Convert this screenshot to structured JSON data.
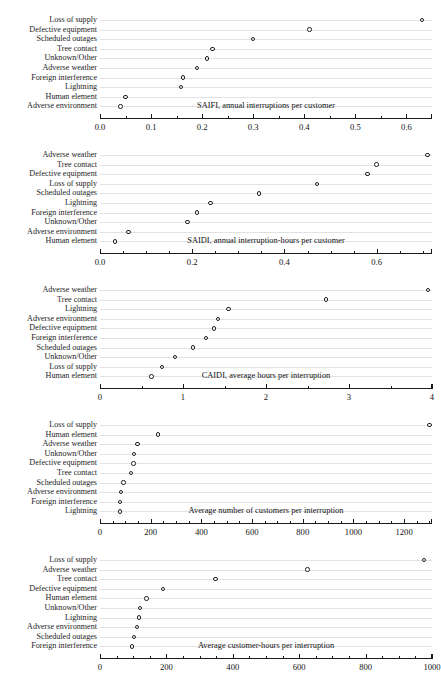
{
  "figure": {
    "panel_count": 5,
    "marker": "open-circle",
    "grid": "horizontal-dotted-guides"
  },
  "chart_data": [
    {
      "type": "scatter",
      "title": "SAIFI, annual interruptions per customer",
      "xlabel": "",
      "ylabel": "",
      "orientation": "horizontal-dot-plot",
      "xlim": [
        0.0,
        0.65
      ],
      "xticks": [
        0.0,
        0.1,
        0.2,
        0.3,
        0.4,
        0.5,
        0.6
      ],
      "xticklabels": [
        "0.0",
        "0.1",
        "0.2",
        "0.3",
        "0.4",
        "0.5",
        "0.6"
      ],
      "minor_ticks": [
        0.05,
        0.15,
        0.25,
        0.35,
        0.45,
        0.55
      ],
      "categories": [
        "Loss of supply",
        "Defective equipment",
        "Scheduled outages",
        "Tree contact",
        "Unknown/Other",
        "Adverse weather",
        "Foreign interference",
        "Lightning",
        "Human element",
        "Adverse environment"
      ],
      "values": [
        0.63,
        0.41,
        0.3,
        0.22,
        0.21,
        0.19,
        0.163,
        0.158,
        0.05,
        0.04
      ]
    },
    {
      "type": "scatter",
      "title": "SAIDI, annual interruption-hours per customer",
      "xlabel": "",
      "ylabel": "",
      "orientation": "horizontal-dot-plot",
      "xlim": [
        0.0,
        0.72
      ],
      "xticks": [
        0.0,
        0.2,
        0.4,
        0.6
      ],
      "xticklabels": [
        "0.0",
        "0.2",
        "0.4",
        "0.6"
      ],
      "minor_ticks": [
        0.05,
        0.1,
        0.15,
        0.25,
        0.3,
        0.35,
        0.45,
        0.5,
        0.55,
        0.65,
        0.7
      ],
      "categories": [
        "Adverse weather",
        "Tree contact",
        "Defective equipment",
        "Loss of supply",
        "Scheduled outages",
        "Lightning",
        "Foreign interference",
        "Unknown/Other",
        "Adverse environment",
        "Human element"
      ],
      "values": [
        0.71,
        0.6,
        0.58,
        0.47,
        0.345,
        0.24,
        0.21,
        0.19,
        0.062,
        0.032
      ]
    },
    {
      "type": "scatter",
      "title": "CAIDI, average hours per interruption",
      "xlabel": "",
      "ylabel": "",
      "orientation": "horizontal-dot-plot",
      "xlim": [
        0,
        4
      ],
      "xticks": [
        0,
        1,
        2,
        3,
        4
      ],
      "xticklabels": [
        "0",
        "1",
        "2",
        "3",
        "4"
      ],
      "minor_ticks": [
        0.5,
        1.5,
        2.5,
        3.5
      ],
      "categories": [
        "Adverse weather",
        "Tree contact",
        "Lightning",
        "Adverse environment",
        "Defective equipment",
        "Foreign interference",
        "Scheduled outages",
        "Unknown/Other",
        "Loss of supply",
        "Human element"
      ],
      "values": [
        3.95,
        2.72,
        1.55,
        1.42,
        1.37,
        1.28,
        1.12,
        0.9,
        0.75,
        0.62
      ]
    },
    {
      "type": "scatter",
      "title": "Average number of customers per interruption",
      "xlabel": "",
      "ylabel": "",
      "orientation": "horizontal-dot-plot",
      "xlim": [
        0,
        1310
      ],
      "xticks": [
        0,
        200,
        400,
        600,
        800,
        1000,
        1200
      ],
      "xticklabels": [
        "0",
        "200",
        "400",
        "600",
        "800",
        "1000",
        "1200"
      ],
      "minor_ticks": [
        50,
        100,
        150,
        250,
        300,
        350,
        450,
        500,
        550,
        650,
        700,
        750,
        850,
        900,
        950,
        1050,
        1100,
        1150,
        1250,
        1300
      ],
      "categories": [
        "Loss of supply",
        "Human element",
        "Adverse weather",
        "Unknown/Other",
        "Defective equipment",
        "Tree contact",
        "Scheduled outages",
        "Adverse environment",
        "Foreign interference",
        "Lightning"
      ],
      "values": [
        1300,
        228,
        148,
        135,
        132,
        122,
        93,
        82,
        80,
        78
      ]
    },
    {
      "type": "scatter",
      "title": "Average customer-hours per interruption",
      "xlabel": "",
      "ylabel": "",
      "orientation": "horizontal-dot-plot",
      "xlim": [
        0,
        1000
      ],
      "xticks": [
        0,
        200,
        400,
        600,
        800,
        1000
      ],
      "xticklabels": [
        "0",
        "200",
        "400",
        "600",
        "800",
        "1000"
      ],
      "minor_ticks": [
        50,
        100,
        150,
        250,
        300,
        350,
        450,
        500,
        550,
        650,
        700,
        750,
        850,
        900,
        950
      ],
      "categories": [
        "Loss of supply",
        "Adverse weather",
        "Tree contact",
        "Defective equipment",
        "Human element",
        "Unknown/Other",
        "Lightning",
        "Adverse environment",
        "Scheduled outages",
        "Foreign interference"
      ],
      "values": [
        975,
        625,
        348,
        190,
        140,
        120,
        118,
        112,
        102,
        97
      ]
    }
  ]
}
